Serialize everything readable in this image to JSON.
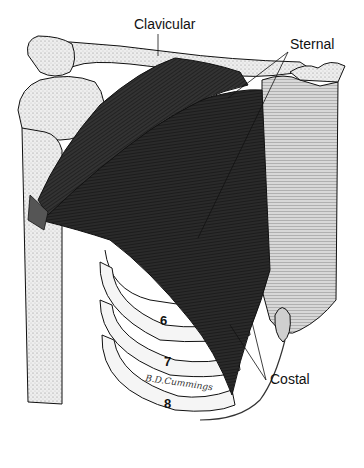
{
  "figure": {
    "labels": {
      "clavicular": "Clavicular",
      "sternal": "Sternal",
      "costal": "Costal"
    },
    "rib_numbers": [
      "6",
      "7",
      "8"
    ],
    "signature": "B.D.Cummings",
    "colors": {
      "muscle": "#1a1a1a",
      "muscle_fiber": "#3a3a3a",
      "bone": "#f2f2f2",
      "bone_shade": "#9a9a9a",
      "outline": "#111111",
      "background": "#ffffff"
    }
  }
}
